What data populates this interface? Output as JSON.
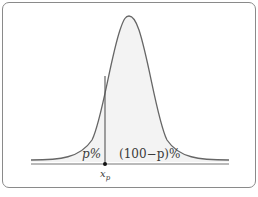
{
  "diagram": {
    "type": "normal-distribution-percentile",
    "labels": {
      "left_area": "p%",
      "right_area": "(100−p)%",
      "point": "x",
      "point_subscript": "p"
    },
    "colors": {
      "curve": "#666666",
      "fill": "#f3f3f3",
      "axis": "#777777",
      "frame": "#8a8a8a",
      "point": "#111111"
    }
  }
}
